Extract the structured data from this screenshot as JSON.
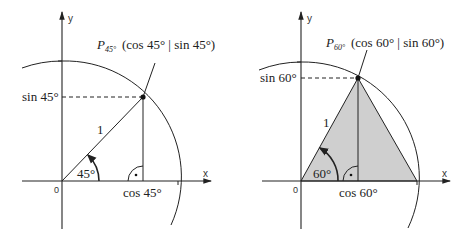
{
  "colors": {
    "line": "#222222",
    "fill": "#cfcfcf",
    "background": "#ffffff"
  },
  "left": {
    "axis_x_label": "x",
    "axis_y_label": "y",
    "origin_label": "0",
    "point_label_main": "P",
    "point_label_sub": "45°",
    "point_coords": "(cos 45° | sin 45°)",
    "sin_label": "sin 45°",
    "cos_label": "cos 45°",
    "radius_label": "1",
    "angle_label": "45°",
    "angle_deg": 45
  },
  "right": {
    "axis_x_label": "x",
    "axis_y_label": "y",
    "origin_label": "0",
    "point_label_main": "P",
    "point_label_sub": "60°",
    "point_coords": "(cos 60° | sin 60°)",
    "sin_label": "sin 60°",
    "cos_label": "cos 60°",
    "radius_label": "1",
    "angle_label": "60°",
    "angle_deg": 60
  }
}
